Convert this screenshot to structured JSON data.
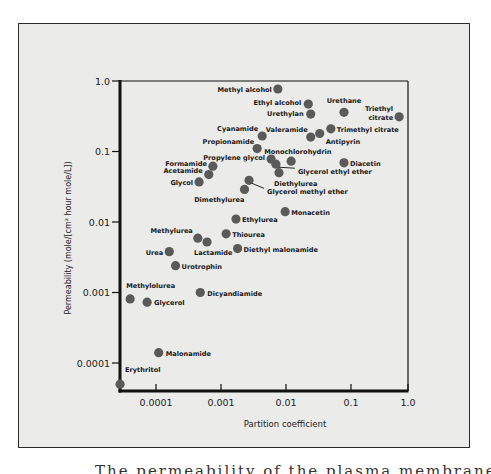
{
  "chart_data": {
    "type": "scatter",
    "title": "",
    "xlabel": "Partition coefficient",
    "ylabel": "Permeability (mole/[cm² hour mole/L])",
    "xscale": "log",
    "yscale": "log",
    "xlim": [
      2.8e-05,
      1.0
    ],
    "ylim": [
      5e-05,
      1.0
    ],
    "x_ticks": [
      "0.0001",
      "0.001",
      "0.01",
      "0.1",
      "1.0"
    ],
    "y_ticks": [
      "1.0",
      "0.1",
      "0.01",
      "0.001",
      "0.0001"
    ],
    "grid": false,
    "legend": "none",
    "marker_color": "#5a5a5a",
    "points": [
      {
        "label": "Methyl alcohol",
        "x": 0.0075,
        "y": 0.77
      },
      {
        "label": "Ethyl alcohol",
        "x": 0.022,
        "y": 0.47
      },
      {
        "label": "Urethylan",
        "x": 0.024,
        "y": 0.34
      },
      {
        "label": "Urethane",
        "x": 0.078,
        "y": 0.36
      },
      {
        "label": "Triethyl citrate",
        "x": 0.55,
        "y": 0.31
      },
      {
        "label": "Trimethyl citrate",
        "x": 0.049,
        "y": 0.21
      },
      {
        "label": "Antipyrin",
        "x": 0.033,
        "y": 0.18
      },
      {
        "label": "Valeramide",
        "x": 0.024,
        "y": 0.16
      },
      {
        "label": "Cyanamide",
        "x": 0.0043,
        "y": 0.166
      },
      {
        "label": "Propionamide",
        "x": 0.0036,
        "y": 0.11
      },
      {
        "label": "Propylene glycol",
        "x": 0.0059,
        "y": 0.078
      },
      {
        "label": "Glycerol ethyl ether",
        "x": 0.007,
        "y": 0.066
      },
      {
        "label": "Monochlorohydrin",
        "x": 0.012,
        "y": 0.073
      },
      {
        "label": "Diacetin",
        "x": 0.078,
        "y": 0.069
      },
      {
        "label": "Formamide",
        "x": 0.00075,
        "y": 0.062
      },
      {
        "label": "Acetamide",
        "x": 0.00065,
        "y": 0.047
      },
      {
        "label": "Glycol",
        "x": 0.00046,
        "y": 0.037
      },
      {
        "label": "Diethylurea",
        "x": 0.0078,
        "y": 0.05
      },
      {
        "label": "Glycerol methyl ether",
        "x": 0.0027,
        "y": 0.039
      },
      {
        "label": "Dimethylurea",
        "x": 0.0023,
        "y": 0.029
      },
      {
        "label": "Monacetin",
        "x": 0.0097,
        "y": 0.014
      },
      {
        "label": "Ethylurea",
        "x": 0.0017,
        "y": 0.011
      },
      {
        "label": "Thiourea",
        "x": 0.0012,
        "y": 0.0068
      },
      {
        "label": "Methylurea",
        "x": 0.00044,
        "y": 0.0059
      },
      {
        "label": "Lactamide",
        "x": 0.00061,
        "y": 0.0052
      },
      {
        "label": "Diethyl malonamide",
        "x": 0.0018,
        "y": 0.0042
      },
      {
        "label": "Urea",
        "x": 0.00016,
        "y": 0.0038
      },
      {
        "label": "Urotrophin",
        "x": 0.0002,
        "y": 0.0024
      },
      {
        "label": "Dicyandiamide",
        "x": 0.00048,
        "y": 0.001
      },
      {
        "label": "Methylolurea",
        "x": 4e-05,
        "y": 0.00081
      },
      {
        "label": "Glycerol",
        "x": 7.3e-05,
        "y": 0.00073
      },
      {
        "label": "Malonamide",
        "x": 0.00011,
        "y": 0.00014
      },
      {
        "label": "Erythritol",
        "x": 2.8e-05,
        "y": 5e-05
      }
    ]
  },
  "layout": {
    "plot_left": 120,
    "plot_right": 408,
    "plot_top": 81,
    "plot_bottom": 391,
    "x_px_per_decade": 65,
    "x_ref_px": 156,
    "x_ref_log": -4,
    "y_px_per_decade": 70.5,
    "y_ref_px": 81,
    "y_ref_log": 0,
    "label_placement": {
      "Methyl alcohol": {
        "dx": -6,
        "dy": 3,
        "anchor": "end"
      },
      "Ethyl alcohol": {
        "dx": -7,
        "dy": 1,
        "anchor": "end"
      },
      "Urethylan": {
        "dx": -7,
        "dy": 2,
        "anchor": "end"
      },
      "Urethane": {
        "dx": 0,
        "dy": -9,
        "anchor": "middle"
      },
      "Triethyl citrate": {
        "dx": -6,
        "dy": -6,
        "anchor": "end",
        "multiline": [
          "Triethyl",
          "citrate"
        ]
      },
      "Trimethyl citrate": {
        "dx": 6,
        "dy": 3,
        "anchor": "start"
      },
      "Antipyrin": {
        "dx": 6,
        "dy": 10,
        "anchor": "start",
        "label_offset_only": true
      },
      "Valeramide": {
        "dx": -3,
        "dy": -5,
        "anchor": "end"
      },
      "Cyanamide": {
        "dx": -4,
        "dy": -5,
        "anchor": "end"
      },
      "Propionamide": {
        "dx": -3,
        "dy": -5,
        "anchor": "end"
      },
      "Propylene glycol": {
        "dx": -6,
        "dy": 1,
        "anchor": "end"
      },
      "Glycerol ethyl ether": {
        "dx": 22,
        "dy": 10,
        "anchor": "start",
        "leader": true
      },
      "Monochlorohydrin": {
        "dx": -7,
        "dy": -7,
        "anchor": "start",
        "offset_x": -20
      },
      "Diacetin": {
        "dx": 6,
        "dy": 3,
        "anchor": "start"
      },
      "Formamide": {
        "dx": -6,
        "dy": 0,
        "anchor": "end"
      },
      "Acetamide": {
        "dx": -6,
        "dy": -2,
        "anchor": "end"
      },
      "Glycol": {
        "dx": -6,
        "dy": 3,
        "anchor": "end"
      },
      "Diethylurea": {
        "dx": -5,
        "dy": 13,
        "anchor": "start"
      },
      "Glycerol methyl ether": {
        "dx": 18,
        "dy": 14,
        "anchor": "start",
        "leader": true
      },
      "Dimethylurea": {
        "dx": 0,
        "dy": 13,
        "anchor": "end"
      },
      "Monacetin": {
        "dx": 6,
        "dy": 3,
        "anchor": "start"
      },
      "Ethylurea": {
        "dx": 6,
        "dy": 3,
        "anchor": "start"
      },
      "Thiourea": {
        "dx": 6,
        "dy": 3,
        "anchor": "start"
      },
      "Methylurea": {
        "dx": -5,
        "dy": -5,
        "anchor": "end"
      },
      "Lactamide": {
        "dx": -13,
        "dy": 13,
        "anchor": "start"
      },
      "Diethyl malonamide": {
        "dx": 6,
        "dy": 3,
        "anchor": "start"
      },
      "Urea": {
        "dx": -6,
        "dy": 3,
        "anchor": "end"
      },
      "Urotrophin": {
        "dx": 6,
        "dy": 3,
        "anchor": "start"
      },
      "Dicyandiamide": {
        "dx": 7,
        "dy": 3,
        "anchor": "start"
      },
      "Methylolurea": {
        "dx": -4,
        "dy": -11,
        "anchor": "start"
      },
      "Glycerol": {
        "dx": 7,
        "dy": 3,
        "anchor": "start"
      },
      "Malonamide": {
        "dx": 7,
        "dy": 3,
        "anchor": "start"
      },
      "Erythritol": {
        "dx": 5,
        "dy": -12,
        "anchor": "start"
      }
    }
  },
  "caption": "The permeability of the plasma membrane of the alga Chara ceratophylla to various"
}
